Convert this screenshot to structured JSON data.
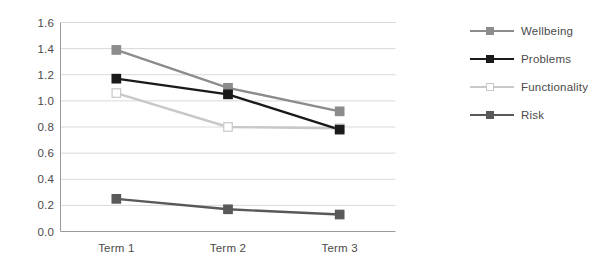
{
  "chart_data": {
    "type": "line",
    "title": "",
    "xlabel": "",
    "ylabel": "",
    "categories": [
      "Term 1",
      "Term 2",
      "Term 3"
    ],
    "ylim": [
      0.0,
      1.6
    ],
    "yticks": [
      "0.0",
      "0.2",
      "0.4",
      "0.6",
      "0.8",
      "1.0",
      "1.2",
      "1.4",
      "1.6"
    ],
    "ytick_values": [
      0.0,
      0.2,
      0.4,
      0.6,
      0.8,
      1.0,
      1.2,
      1.4,
      1.6
    ],
    "grid": true,
    "grid_axis": "y",
    "legend_position": "right",
    "series": [
      {
        "name": "Wellbeing",
        "values": [
          1.39,
          1.1,
          0.92
        ],
        "color": "#8c8c8c",
        "marker": "square",
        "marker_fill": "#8c8c8c"
      },
      {
        "name": "Problems",
        "values": [
          1.17,
          1.05,
          0.78
        ],
        "color": "#1a1a1a",
        "marker": "square",
        "marker_fill": "#1a1a1a"
      },
      {
        "name": "Functionality",
        "values": [
          1.06,
          0.8,
          0.79
        ],
        "color": "#c8c8c8",
        "marker": "square",
        "marker_fill": "#ffffff"
      },
      {
        "name": "Risk",
        "values": [
          0.25,
          0.17,
          0.13
        ],
        "color": "#595959",
        "marker": "square",
        "marker_fill": "#595959"
      }
    ]
  },
  "axes": {
    "axis_line_color": "#9a9a9a",
    "grid_line_color": "#d9d9d9",
    "tick_label_color": "#4a4a4a"
  }
}
